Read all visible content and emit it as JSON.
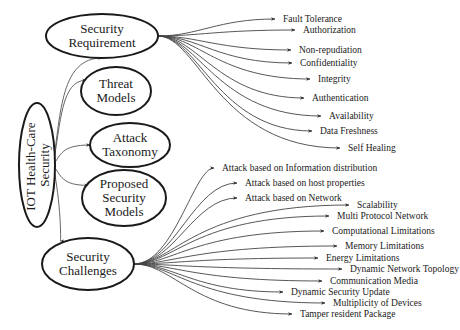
{
  "diagram": {
    "title": "IOT Health-Care Security",
    "root": {
      "label_line1": "IOT Health-Care",
      "label_line2": "Security",
      "cx": 37,
      "cy": 165,
      "rx": 18,
      "ry": 62
    },
    "categories": [
      {
        "id": "security-requirement",
        "lines": [
          "Security",
          "Requirement"
        ],
        "cx": 102,
        "cy": 36,
        "rx": 56,
        "ry": 22
      },
      {
        "id": "threat-models",
        "lines": [
          "Threat",
          "Models"
        ],
        "cx": 116,
        "cy": 91,
        "rx": 35,
        "ry": 24
      },
      {
        "id": "attack-taxonomy",
        "lines": [
          "Attack",
          "Taxonomy"
        ],
        "cx": 130,
        "cy": 145,
        "rx": 40,
        "ry": 22
      },
      {
        "id": "proposed-security-models",
        "lines": [
          "Proposed",
          "Security",
          "Models"
        ],
        "cx": 124,
        "cy": 198,
        "rx": 42,
        "ry": 28
      },
      {
        "id": "security-challenges",
        "lines": [
          "Security",
          "Challenges"
        ],
        "cx": 88,
        "cy": 264,
        "rx": 46,
        "ry": 26
      }
    ],
    "security_requirement_items": [
      {
        "label": "Fault Tolerance",
        "x": 283,
        "y": 19
      },
      {
        "label": "Authorization",
        "x": 303,
        "y": 30
      },
      {
        "label": "Non-repudiation",
        "x": 299,
        "y": 50
      },
      {
        "label": "Confidentiality",
        "x": 300,
        "y": 63
      },
      {
        "label": "Integrity",
        "x": 318,
        "y": 79
      },
      {
        "label": "Authentication",
        "x": 312,
        "y": 98
      },
      {
        "label": "Availability",
        "x": 329,
        "y": 116
      },
      {
        "label": "Data Freshness",
        "x": 320,
        "y": 131
      },
      {
        "label": "Self Healing",
        "x": 348,
        "y": 148
      }
    ],
    "attack_taxonomy_items": [
      {
        "label": "Attack based on Information distribution",
        "x": 222,
        "y": 168
      },
      {
        "label": "Attack based on host properties",
        "x": 245,
        "y": 183
      },
      {
        "label": "Attack based on Network",
        "x": 245,
        "y": 198
      }
    ],
    "security_challenges_items": [
      {
        "label": "Scalability",
        "x": 357,
        "y": 205
      },
      {
        "label": "Multi Protocol Network",
        "x": 337,
        "y": 216
      },
      {
        "label": "Computational Limitations",
        "x": 332,
        "y": 231
      },
      {
        "label": "Memory Limitations",
        "x": 345,
        "y": 246
      },
      {
        "label": "Energy Limitations",
        "x": 326,
        "y": 258
      },
      {
        "label": "Dynamic Network Topology",
        "x": 350,
        "y": 269
      },
      {
        "label": "Communication Media",
        "x": 330,
        "y": 281
      },
      {
        "label": "Dynamic Security Update",
        "x": 291,
        "y": 292
      },
      {
        "label": "Multiplicity of Devices",
        "x": 333,
        "y": 303
      },
      {
        "label": "Tamper resident Package",
        "x": 300,
        "y": 314
      }
    ],
    "colors": {
      "stroke": "#1a1a1a",
      "edge": "#444444",
      "background": "#ffffff"
    }
  }
}
